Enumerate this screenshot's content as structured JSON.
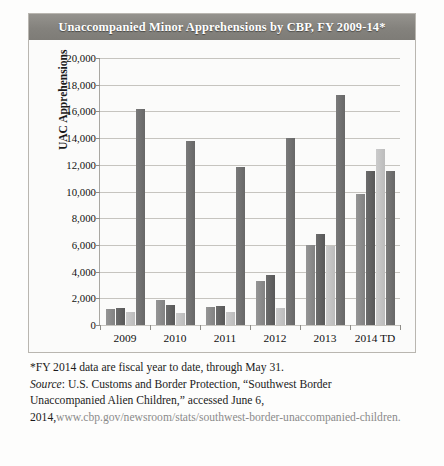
{
  "figure": {
    "title": "Unaccompanied Minor Apprehensions by CBP, FY 2009-14*",
    "ylabel": "UAC Apprehensions"
  },
  "notes": {
    "footnote": "*FY 2014 data are fiscal year to date, through May 31.",
    "source_label": "Source",
    "source_line1": ": U.S. Customs and Border Protection, “Southwest Border",
    "source_line2": "Unaccompanied Alien Children,” accessed June 6,",
    "source_line3_year": "2014,",
    "source_line3_url": "www.cbp.gov/newsroom/stats/southwest-border-unaccompanied-children."
  },
  "chart_data": {
    "type": "bar",
    "title": "Unaccompanied Minor Apprehensions by CBP, FY 2009-14*",
    "xlabel": "",
    "ylabel": "UAC Apprehensions",
    "ylim": [
      0,
      20000
    ],
    "ytick_labels": [
      "20,000",
      "18,000",
      "16,000",
      "14,000",
      "12,000",
      "10,000",
      "8,000",
      "6,000",
      "4,000",
      "2,000",
      "0"
    ],
    "ytick_values": [
      20000,
      18000,
      16000,
      14000,
      12000,
      10000,
      8000,
      6000,
      4000,
      2000,
      0
    ],
    "grid": true,
    "legend": "none",
    "categories": [
      "2009",
      "2010",
      "2011",
      "2012",
      "2013",
      "2014 TD"
    ],
    "series": [
      {
        "name": "series-1",
        "color": "#8a8a8a",
        "values": [
          1200,
          1850,
          1350,
          3300,
          6000,
          9800
        ]
      },
      {
        "name": "series-2",
        "color": "#5f5f5f",
        "values": [
          1250,
          1500,
          1450,
          3750,
          6800,
          11500
        ]
      },
      {
        "name": "series-3",
        "color": "#c2c2c2",
        "values": [
          970,
          900,
          950,
          1300,
          5950,
          13200
        ]
      },
      {
        "name": "series-4",
        "color": "#6e6e6e",
        "values": [
          16150,
          13750,
          11800,
          14000,
          17250,
          11550
        ]
      }
    ]
  }
}
